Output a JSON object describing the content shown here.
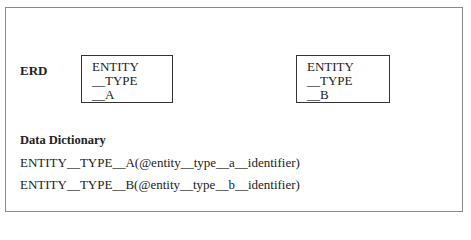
{
  "erd": {
    "label": "ERD",
    "entities": [
      {
        "lines": [
          "ENTITY",
          "__TYPE",
          "__A"
        ]
      },
      {
        "lines": [
          "ENTITY",
          "__TYPE",
          "__B"
        ]
      }
    ]
  },
  "data_dictionary": {
    "title": "Data Dictionary",
    "entries": [
      "ENTITY__TYPE__A(@entity__type__a__identifier)",
      "ENTITY__TYPE__B(@entity__type__b__identifier)"
    ]
  }
}
